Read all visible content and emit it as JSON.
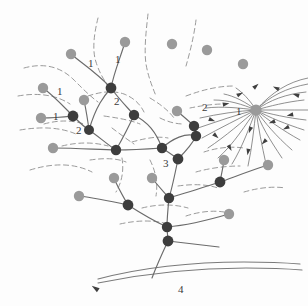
{
  "figure": {
    "width": 308,
    "height": 306,
    "background_color": "#fdfdfd"
  },
  "legend_colors": {
    "junction_node": "#3d3d3d",
    "source_node": "#9a9a9a",
    "channel_stroke": "#6b6b6b",
    "divide_stroke": "#8e8e8e",
    "trunk_stroke": "#7a7a7a",
    "label_color": "#3a3a3a"
  },
  "order_labels": [
    {
      "text": "1",
      "x": 88,
      "y": 58
    },
    {
      "text": "1",
      "x": 115,
      "y": 54
    },
    {
      "text": "1",
      "x": 57,
      "y": 86
    },
    {
      "text": "1",
      "x": 53,
      "y": 111
    },
    {
      "text": "2",
      "x": 76,
      "y": 125
    },
    {
      "text": "2",
      "x": 114,
      "y": 96
    },
    {
      "text": "2",
      "x": 202,
      "y": 102
    },
    {
      "text": "1",
      "x": 236,
      "y": 106
    },
    {
      "text": "3",
      "x": 163,
      "y": 158
    },
    {
      "text": "4",
      "x": 178,
      "y": 284
    }
  ],
  "junction_nodes": [
    {
      "name": "junction-top-center",
      "x": 111,
      "y": 88,
      "r": 5.4
    },
    {
      "name": "junction-left-upper",
      "x": 73,
      "y": 116,
      "r": 5.4
    },
    {
      "name": "junction-left-lower",
      "x": 89,
      "y": 130,
      "r": 5.0
    },
    {
      "name": "junction-mid-upper",
      "x": 134,
      "y": 115,
      "r": 5.2
    },
    {
      "name": "junction-mid-left",
      "x": 116,
      "y": 150,
      "r": 5.2
    },
    {
      "name": "junction-center",
      "x": 162,
      "y": 148,
      "r": 5.2
    },
    {
      "name": "junction-order3",
      "x": 178,
      "y": 159,
      "r": 5.4
    },
    {
      "name": "junction-right-upper",
      "x": 194,
      "y": 126,
      "r": 5.2
    },
    {
      "name": "junction-right-mid",
      "x": 196,
      "y": 136,
      "r": 5.2
    },
    {
      "name": "junction-right-low",
      "x": 220,
      "y": 182,
      "r": 5.4
    },
    {
      "name": "junction-lower-left",
      "x": 128,
      "y": 205,
      "r": 5.4
    },
    {
      "name": "junction-lower-mid",
      "x": 169,
      "y": 198,
      "r": 5.2
    },
    {
      "name": "junction-lower-stem",
      "x": 167,
      "y": 227,
      "r": 5.2
    },
    {
      "name": "junction-trunk-head",
      "x": 168,
      "y": 241,
      "r": 5.4
    }
  ],
  "source_nodes": [
    {
      "name": "source-top-a",
      "x": 71,
      "y": 54,
      "r": 5.2
    },
    {
      "name": "source-top-b",
      "x": 125,
      "y": 42,
      "r": 5.2
    },
    {
      "name": "source-top-c",
      "x": 172,
      "y": 44,
      "r": 5.2
    },
    {
      "name": "source-top-d",
      "x": 207,
      "y": 50,
      "r": 5.2
    },
    {
      "name": "source-top-e",
      "x": 243,
      "y": 64,
      "r": 5.2
    },
    {
      "name": "source-left-a",
      "x": 43,
      "y": 88,
      "r": 5.2
    },
    {
      "name": "source-left-b",
      "x": 41,
      "y": 118,
      "r": 5.2
    },
    {
      "name": "source-left-c",
      "x": 84,
      "y": 100,
      "r": 5.2
    },
    {
      "name": "source-left-d",
      "x": 53,
      "y": 148,
      "r": 5.2
    },
    {
      "name": "source-mid-a",
      "x": 177,
      "y": 111,
      "r": 5.2
    },
    {
      "name": "source-fan-hub",
      "x": 256,
      "y": 110,
      "r": 5.6
    },
    {
      "name": "source-mid-b",
      "x": 114,
      "y": 178,
      "r": 5.2
    },
    {
      "name": "source-mid-c",
      "x": 152,
      "y": 178,
      "r": 5.2
    },
    {
      "name": "source-low-a",
      "x": 79,
      "y": 196,
      "r": 5.2
    },
    {
      "name": "source-right-a",
      "x": 224,
      "y": 160,
      "r": 5.2
    },
    {
      "name": "source-right-b",
      "x": 268,
      "y": 165,
      "r": 5.2
    },
    {
      "name": "source-right-c",
      "x": 229,
      "y": 214,
      "r": 5.2
    }
  ],
  "channels": [
    "M71,54 C80,62 96,72 111,88",
    "M125,42 C121,56 114,72 111,88",
    "M111,88 C118,98 127,107 134,115",
    "M43,88 C53,95 64,107 73,116",
    "M41,118 C52,118 64,117 73,116",
    "M84,100 C86,110 88,122 89,130",
    "M73,116 C79,122 84,127 89,130",
    "M89,130 C98,136 108,145 116,150",
    "M134,115 C130,124 124,136 116,150",
    "M116,150 C131,150 148,149 162,148",
    "M53,148 C80,148 100,150 116,150",
    "M162,148 C168,152 174,156 178,159",
    "M177,111 C184,117 190,122 194,126",
    "M194,126 C195,130 195,133 196,136",
    "M196,136 C192,145 184,153 178,159",
    "M178,159 C175,174 172,188 169,198",
    "M169,198 C168,208 167,220 167,227",
    "M167,227 C167,232 168,237 168,241",
    "M114,178 C118,188 124,198 128,205",
    "M152,178 C158,186 165,193 169,198",
    "M79,196 C95,198 114,202 128,205",
    "M128,205 C142,214 156,222 167,227",
    "M224,160 C223,168 221,176 220,182",
    "M268,165 C252,170 234,177 220,182",
    "M220,182 C205,187 185,193 169,198",
    "M229,214 C212,219 190,225 167,227",
    "M168,241 C185,243 202,245 219,247",
    "M168,241 C160,258 155,270 152,278",
    "M111,88 C104,96 96,106 89,130",
    "M134,115 C148,122 156,132 162,148",
    "M162,148 C172,139 186,132 196,136"
  ],
  "divides": [
    "M24,68 C46,62 62,68 74,80 C84,90 90,96 98,102",
    "M18,96 C40,92 58,96 70,104",
    "M20,130 C44,126 62,128 76,134",
    "M30,170 C56,162 76,164 92,172",
    "M98,18 C94,34 92,50 96,62 C99,72 104,80 108,86",
    "M148,14 C146,32 144,50 146,64 C148,76 152,86 156,96",
    "M196,20 C194,36 190,52 186,66",
    "M88,96 C100,92 112,90 124,94 C134,98 140,104 144,112",
    "M104,116 C118,118 130,120 140,124",
    "M132,142 C146,138 158,136 168,138",
    "M160,118 C168,122 176,124 184,124",
    "M150,160 C156,172 158,184 156,196",
    "M122,158 C124,170 122,182 116,192",
    "M90,160 C104,158 116,158 126,162",
    "M186,96 C202,90 218,86 234,86",
    "M190,108 C200,106 212,104 224,104",
    "M204,152 C216,148 230,146 244,148",
    "M196,172 C210,168 226,166 240,166",
    "M178,186 C192,184 206,184 218,188",
    "M142,208 C158,204 174,204 188,208",
    "M120,224 C138,220 154,220 168,224",
    "M186,216 C198,212 212,210 224,212",
    "M244,192 C258,188 272,186 286,188",
    "M62,146 C78,142 94,142 108,146",
    "M44,124 C58,120 72,120 84,124",
    "M150,98 C160,104 168,110 174,118",
    "M112,128 C120,134 128,140 134,144"
  ],
  "fan": {
    "hub_x": 256,
    "hub_y": 110,
    "curves": [
      "M308,78 C288,82 272,92 256,110",
      "M308,84 C286,88 270,96 256,110",
      "M306,92 C286,94 270,100 256,110",
      "M304,100 C286,102 270,106 256,110",
      "M308,110 C290,110 272,110 256,110",
      "M306,120 C288,118 270,114 256,110",
      "M304,130 C286,124 270,118 256,110",
      "M300,140 C282,130 268,120 256,110",
      "M292,150 C276,136 264,122 256,110",
      "M282,158 C270,140 260,124 256,110",
      "M266,164 C262,146 258,126 256,110",
      "M248,166 C252,148 254,128 256,110",
      "M232,164 C242,148 250,126 256,110",
      "M218,158 C234,144 246,124 256,110",
      "M208,148 C226,136 242,122 256,110",
      "M202,138 C220,128 240,118 256,110",
      "M198,128 C216,122 238,114 256,110",
      "M200,118 C218,114 238,111 256,110",
      "M206,108 C222,106 240,108 256,110",
      "M214,100 C228,100 242,104 256,110",
      "M224,94 C234,96 246,102 256,110",
      "M236,88 C242,92 250,100 256,110"
    ],
    "arrows": [
      {
        "x": 296,
        "y": 95,
        "angle": 196
      },
      {
        "x": 290,
        "y": 115,
        "angle": 168
      },
      {
        "x": 286,
        "y": 128,
        "angle": 156
      },
      {
        "x": 276,
        "y": 88,
        "angle": 204
      },
      {
        "x": 264,
        "y": 142,
        "angle": 135
      },
      {
        "x": 248,
        "y": 152,
        "angle": 100
      },
      {
        "x": 230,
        "y": 148,
        "angle": 62
      },
      {
        "x": 216,
        "y": 136,
        "angle": 42
      },
      {
        "x": 212,
        "y": 120,
        "angle": 20
      },
      {
        "x": 226,
        "y": 104,
        "angle": 348
      },
      {
        "x": 240,
        "y": 94,
        "angle": 332
      },
      {
        "x": 256,
        "y": 86,
        "angle": 318
      },
      {
        "x": 272,
        "y": 122,
        "angle": 160
      },
      {
        "x": 250,
        "y": 130,
        "angle": 110
      }
    ]
  },
  "trunk": {
    "upper_path": "M98,279 C140,268 190,262 244,262 C268,262 288,263 300,264",
    "lower_path": "M98,283 C142,274 192,268 246,268 C270,268 290,269 302,270",
    "arrow_tip": {
      "x": 95,
      "y": 288,
      "angle": 215
    }
  }
}
